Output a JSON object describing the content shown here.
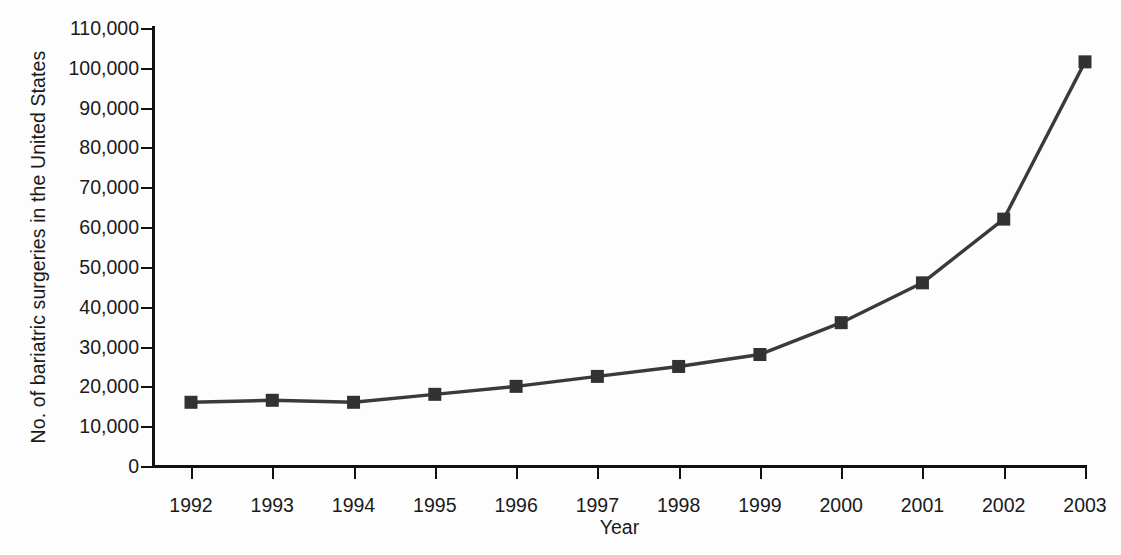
{
  "chart_data": {
    "type": "line",
    "title": "",
    "subtitle": "",
    "xlabel": "Year",
    "ylabel": "No. of bariatric surgeries in the United States",
    "x": [
      1992,
      1993,
      1994,
      1995,
      1996,
      1997,
      1998,
      1999,
      2000,
      2001,
      2002,
      2003
    ],
    "categories": [
      "1992",
      "1993",
      "1994",
      "1995",
      "1996",
      "1997",
      "1998",
      "1999",
      "2000",
      "2001",
      "2002",
      "2003"
    ],
    "values": [
      16000,
      16500,
      16000,
      18000,
      20000,
      22500,
      25000,
      28000,
      36000,
      46000,
      62000,
      101500
    ],
    "series": [
      {
        "name": "No. of bariatric surgeries",
        "values": [
          16000,
          16500,
          16000,
          18000,
          20000,
          22500,
          25000,
          28000,
          36000,
          46000,
          62000,
          101500
        ]
      }
    ],
    "ylim": [
      0,
      110000
    ],
    "xlim": [
      1992,
      2003
    ],
    "ytick_labels": [
      "110,000",
      "100,000",
      "90,000",
      "80,000",
      "70,000",
      "60,000",
      "50,000",
      "40,000",
      "30,000",
      "20,000",
      "10,000",
      "0"
    ],
    "ytick_values": [
      110000,
      100000,
      90000,
      80000,
      70000,
      60000,
      50000,
      40000,
      30000,
      20000,
      10000,
      0
    ],
    "xtick_labels": [
      "1992",
      "1993",
      "1994",
      "1995",
      "1996",
      "1997",
      "1998",
      "1999",
      "2000",
      "2001",
      "2002",
      "2003"
    ],
    "grid": false,
    "legend": false,
    "legend_position": "none",
    "marker": "square",
    "line_color": "#3a3a3a",
    "marker_color": "#323232",
    "axis_color": "#111111",
    "background_color": "#fdfdfd",
    "annotations": []
  }
}
